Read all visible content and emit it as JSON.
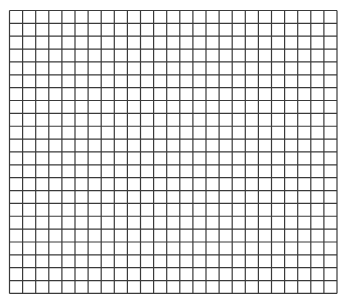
{
  "grid": {
    "columns": 25,
    "rows": 22,
    "origin_x": 9.5,
    "origin_y": 10.5,
    "cell_width": 13.1,
    "cell_height": 12.86,
    "line_color": "#3a3a3a",
    "background_color": "#ffffff",
    "line_width": 1.2
  }
}
